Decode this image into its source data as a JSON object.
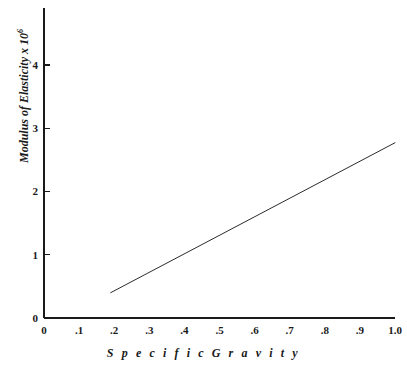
{
  "chart_data": {
    "type": "line",
    "title": "",
    "xlabel": "S p e c i f i c   G r a v i t y",
    "xlabel_plain": "Specific Gravity",
    "ylabel_plain": "Modulus of Elasticity x 10",
    "ylabel_exponent": "6",
    "xlim": [
      0,
      1.0
    ],
    "ylim": [
      0,
      4.9
    ],
    "grid": false,
    "legend": null,
    "xticks": [
      0,
      0.1,
      0.2,
      0.3,
      0.4,
      0.5,
      0.6,
      0.7,
      0.8,
      0.9,
      1.0
    ],
    "xtick_labels": [
      "0",
      ".1",
      ".2",
      ".3",
      ".4",
      ".5",
      ".6",
      ".7",
      ".8",
      ".9",
      "1.0"
    ],
    "yticks": [
      0,
      1,
      2,
      3,
      4
    ],
    "ytick_labels": [
      "0",
      "1",
      "2",
      "3",
      "4"
    ],
    "series": [
      {
        "name": "modulus-vs-specific-gravity",
        "x": [
          0.19,
          1.0
        ],
        "y": [
          0.4,
          2.77
        ],
        "color": "#2b2b2b",
        "linewidth": 1
      }
    ],
    "axis_color": "#1a1a1a"
  },
  "figure": {
    "background": "#ffffff"
  }
}
